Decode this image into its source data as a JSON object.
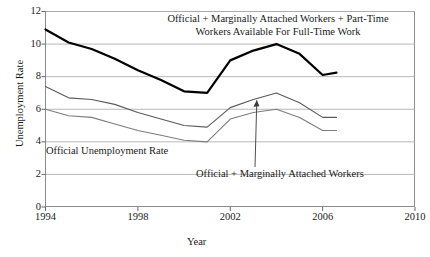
{
  "chart_data": {
    "type": "line",
    "title": "",
    "xlabel": "Year",
    "ylabel": "Unemployment Rate",
    "xlim": [
      1994,
      2010
    ],
    "ylim": [
      0,
      12
    ],
    "xticks": [
      1994,
      1998,
      2002,
      2006,
      2010
    ],
    "yticks": [
      0,
      2,
      4,
      6,
      8,
      10,
      12
    ],
    "grid": true,
    "legend_position": "annotations-inline",
    "series": [
      {
        "name": "Official + Marginally Attached Workers + Part-Time Workers Available For Full-Time Work",
        "color": "#000000",
        "width": 2.2,
        "x": [
          1994,
          1995,
          1996,
          1997,
          1998,
          1999,
          2000,
          2001,
          2002,
          2003,
          2004,
          2005,
          2006,
          2006.6
        ],
        "values": [
          10.9,
          10.1,
          9.7,
          9.1,
          8.4,
          7.8,
          7.1,
          7.0,
          9.0,
          9.6,
          10.0,
          9.4,
          8.1,
          8.25
        ]
      },
      {
        "name": "Official + Marginally Attached Workers",
        "color": "#5a5a5a",
        "width": 1.1,
        "x": [
          1994,
          1995,
          1996,
          1997,
          1998,
          1999,
          2000,
          2001,
          2002,
          2003,
          2004,
          2005,
          2006,
          2006.6
        ],
        "values": [
          7.4,
          6.7,
          6.6,
          6.3,
          5.8,
          5.4,
          5.0,
          4.9,
          6.1,
          6.6,
          7.0,
          6.4,
          5.5,
          5.5
        ]
      },
      {
        "name": "Official Unemployment Rate",
        "color": "#7d7d7d",
        "width": 1.1,
        "x": [
          1994,
          1995,
          1996,
          1997,
          1998,
          1999,
          2000,
          2001,
          2002,
          2003,
          2004,
          2005,
          2006,
          2006.6
        ],
        "values": [
          6.0,
          5.6,
          5.5,
          5.1,
          4.7,
          4.4,
          4.1,
          4.0,
          5.4,
          5.8,
          6.0,
          5.5,
          4.7,
          4.7
        ]
      }
    ],
    "annotations": [
      {
        "id": "top-label",
        "text": "Official + Marginally Attached Workers + Part-Time Workers Available For Full-Time Work"
      },
      {
        "id": "official-label",
        "text": "Official Unemployment Rate"
      },
      {
        "id": "marginal-label",
        "text": "Official + Marginally Attached Workers",
        "arrow": true
      }
    ]
  }
}
